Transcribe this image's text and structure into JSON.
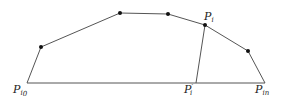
{
  "diagram": {
    "stroke_color": "#555555",
    "dot_color": "#111111",
    "polyline_points": [
      {
        "x": 27,
        "y": 83
      },
      {
        "x": 41,
        "y": 47
      },
      {
        "x": 120,
        "y": 13
      },
      {
        "x": 168,
        "y": 14
      },
      {
        "x": 205,
        "y": 25
      },
      {
        "x": 248,
        "y": 51
      },
      {
        "x": 265,
        "y": 83
      }
    ],
    "dots": [
      {
        "x": 41,
        "y": 47
      },
      {
        "x": 120,
        "y": 13
      },
      {
        "x": 168,
        "y": 14
      },
      {
        "x": 205,
        "y": 25
      },
      {
        "x": 248,
        "y": 51
      }
    ],
    "base_line": {
      "x1": 27,
      "y1": 83,
      "x2": 265,
      "y2": 83
    },
    "projection_line": {
      "x1": 205,
      "y1": 25,
      "x2": 196,
      "y2": 83
    },
    "labels": {
      "p_i0": {
        "main": "P",
        "sub": "i",
        "subsub": "0"
      },
      "p_i_prime": {
        "main": "P",
        "prime": "′",
        "sub": "i"
      },
      "p_in": {
        "main": "P",
        "sub": "i",
        "subsub": "n"
      },
      "p_i": {
        "main": "P",
        "sub": "i"
      }
    }
  }
}
